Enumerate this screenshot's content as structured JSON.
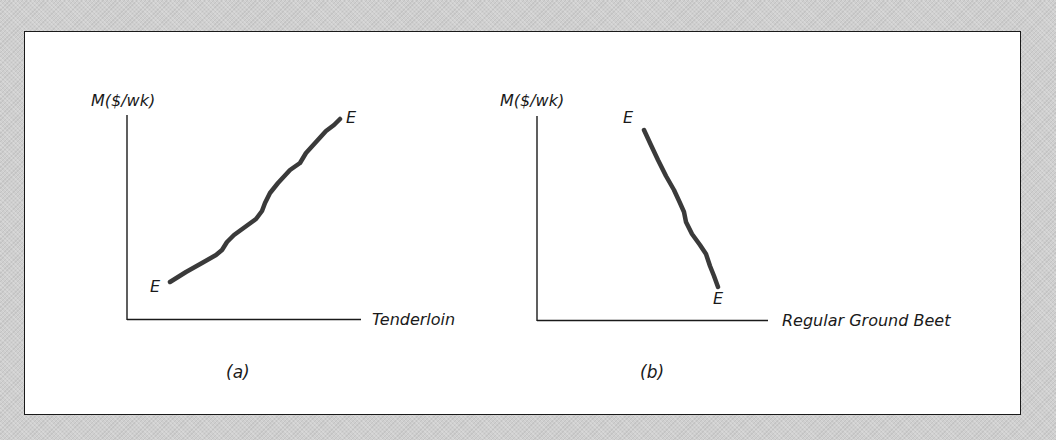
{
  "figure": {
    "panels": [
      {
        "id": "a",
        "caption": "(a)",
        "y_axis_label": "M($/wk)",
        "x_axis_label": "Tenderloin",
        "curve_start_label": "E",
        "curve_end_label": "E",
        "curve_slope": "upward"
      },
      {
        "id": "b",
        "caption": "(b)",
        "y_axis_label": "M($/wk)",
        "x_axis_label": "Regular Ground Beet",
        "curve_start_label": "E",
        "curve_end_label": "E",
        "curve_slope": "downward"
      }
    ],
    "colors": {
      "background": "#cfcfcf",
      "panel": "#ffffff",
      "axis": "#1a1a1a",
      "curve": "#3a3a3a"
    }
  }
}
